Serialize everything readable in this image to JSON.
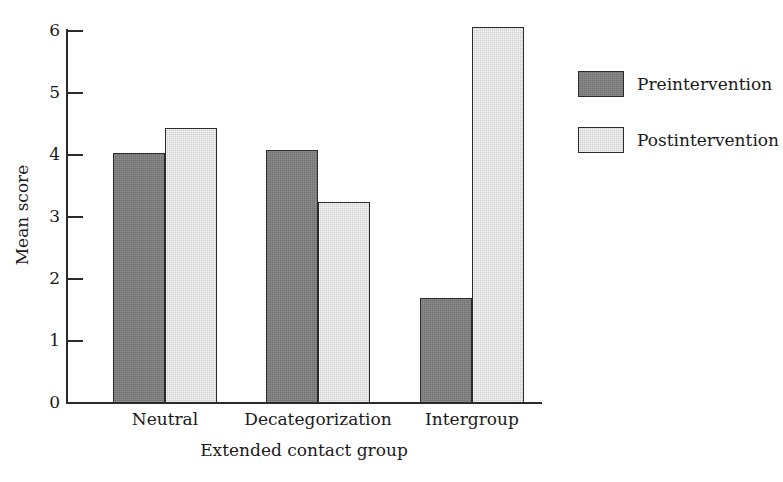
{
  "chart_data": {
    "type": "bar",
    "title": "",
    "subtitle": "",
    "xlabel": "Extended contact group",
    "ylabel": "Mean score",
    "categories": [
      "Neutral",
      "Decategorization",
      "Intergroup"
    ],
    "series": [
      {
        "name": "Preintervention",
        "color": "#7f7f7f",
        "values": [
          4.03,
          4.08,
          1.69
        ]
      },
      {
        "name": "Postintervention",
        "color": "#e2e2e2",
        "values": [
          4.43,
          3.24,
          6.06
        ]
      }
    ],
    "ylim": [
      0,
      6
    ],
    "yticks": [
      0,
      1,
      2,
      3,
      4,
      5,
      6
    ],
    "ytick_labels": [
      "0",
      "1",
      "2",
      "3",
      "4",
      "5",
      "6"
    ],
    "grid": false,
    "legend_position": "right",
    "bar_border_color": "#2b2b2b",
    "axis_color": "#2b2b2b",
    "background_color": "#ffffff"
  },
  "legend": {
    "entries": [
      {
        "label": "Preintervention"
      },
      {
        "label": "Postintervention"
      }
    ]
  }
}
